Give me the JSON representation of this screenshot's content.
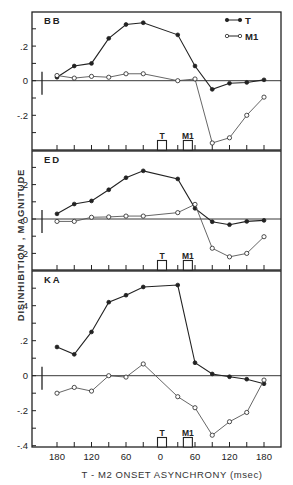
{
  "chart_data": [
    {
      "type": "line",
      "panel_label": "BB",
      "x": [
        -180,
        -150,
        -120,
        -90,
        -60,
        -30,
        30,
        60,
        90,
        120,
        150,
        180
      ],
      "series": [
        {
          "name": "T",
          "marker": "filled",
          "values": [
            0.02,
            0.085,
            0.1,
            0.245,
            0.325,
            0.335,
            0.265,
            0.085,
            -0.05,
            -0.015,
            -0.01,
            0.005
          ]
        },
        {
          "name": "M1",
          "marker": "open",
          "values": [
            0.03,
            0.015,
            0.025,
            0.02,
            0.04,
            0.04,
            0.0,
            0.01,
            -0.36,
            -0.33,
            -0.2,
            -0.095
          ]
        }
      ],
      "ylim": [
        -0.4,
        0.4
      ],
      "yticks": [
        0.2,
        0,
        -0.2
      ],
      "ytick_labels": [
        ".2",
        "0",
        "-.2"
      ],
      "legend": [
        "T",
        "M1"
      ]
    },
    {
      "type": "line",
      "panel_label": "ED",
      "x": [
        -180,
        -150,
        -120,
        -90,
        -60,
        -30,
        30,
        60,
        90,
        120,
        150,
        180
      ],
      "series": [
        {
          "name": "T",
          "marker": "filled",
          "values": [
            0.03,
            0.087,
            0.105,
            0.17,
            0.24,
            0.28,
            0.233,
            0.062,
            -0.016,
            -0.033,
            -0.014,
            -0.008
          ]
        },
        {
          "name": "M1",
          "marker": "open",
          "values": [
            -0.014,
            -0.014,
            0.01,
            0.012,
            0.017,
            0.017,
            0.037,
            0.085,
            -0.17,
            -0.22,
            -0.2,
            -0.103
          ]
        }
      ],
      "ylim": [
        -0.3,
        0.4
      ],
      "yticks": [
        0.2,
        0,
        -0.2
      ],
      "ytick_labels": [
        ".2",
        "0",
        "-.2"
      ]
    },
    {
      "type": "line",
      "panel_label": "KA",
      "x": [
        -180,
        -150,
        -120,
        -90,
        -60,
        -30,
        30,
        60,
        90,
        120,
        150,
        180
      ],
      "series": [
        {
          "name": "T",
          "marker": "filled",
          "values": [
            0.164,
            0.122,
            0.25,
            0.42,
            0.46,
            0.507,
            0.518,
            0.074,
            0.01,
            -0.006,
            -0.02,
            -0.046
          ]
        },
        {
          "name": "M1",
          "marker": "open",
          "values": [
            -0.1,
            -0.067,
            -0.088,
            0.0,
            -0.008,
            0.067,
            -0.12,
            -0.183,
            -0.34,
            -0.263,
            -0.21,
            -0.025
          ]
        }
      ],
      "ylim": [
        -0.4,
        0.6
      ],
      "yticks": [
        0.4,
        0.2,
        0,
        -0.2,
        -0.4
      ],
      "ytick_labels": [
        ".4",
        ".2",
        "0",
        "-.2",
        "-.4"
      ]
    }
  ],
  "figure": {
    "ylabel": "DISINHIBITION , MAGNITUDE",
    "xlabel": "T - M2  ONSET  ASYNCHRONY  (msec)",
    "xtick_labels": [
      "180",
      "120",
      "60",
      "0",
      "60",
      "120",
      "180"
    ],
    "xtick_values": [
      -180,
      -120,
      -60,
      0,
      60,
      120,
      180
    ],
    "stimulus_markers": [
      {
        "label": "T",
        "position": 0
      },
      {
        "label": "M1",
        "position": 45
      }
    ],
    "legend": [
      {
        "label": "T",
        "marker": "filled"
      },
      {
        "label": "M1",
        "marker": "open"
      }
    ],
    "colors": {
      "ink": "#222222",
      "background": "#ffffff",
      "m1_line": "#555555"
    }
  }
}
